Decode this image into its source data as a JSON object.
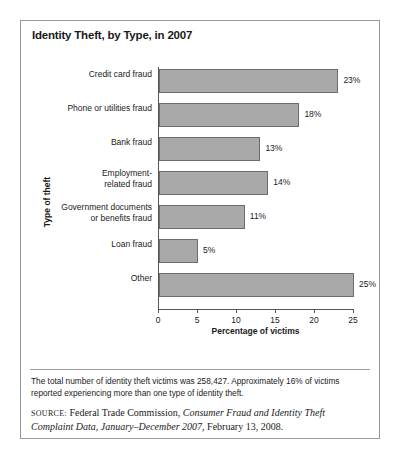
{
  "figure": {
    "title": "Identity Theft, by Type, in 2007",
    "note": "The total number of identity theft victims was 258,427. Approximately 16% of victims reported experiencing more than one type of identity theft.",
    "source": {
      "kicker": "SOURCE:",
      "part1": " Federal Trade Commission, ",
      "italic1": "Consumer Fraud and Identity Theft Complaint Data, January–December 2007",
      "part2": ", February 13, 2008."
    }
  },
  "chart_data": {
    "type": "bar",
    "orientation": "horizontal",
    "title": "Identity Theft, by Type, in 2007",
    "xlabel": "Percentage of victims",
    "ylabel": "Type of theft",
    "xlim": [
      0,
      25
    ],
    "xticks": [
      "0",
      "5",
      "10",
      "15",
      "20",
      "25"
    ],
    "grid": false,
    "legend": false,
    "categories": [
      "Credit card fraud",
      "Phone or utilities fraud",
      "Bank fraud",
      "Employment-related fraud",
      "Government documents or benefits fraud",
      "Loan fraud",
      "Other"
    ],
    "category_lines": [
      [
        "Credit card fraud"
      ],
      [
        "Phone or utilities fraud"
      ],
      [
        "Bank fraud"
      ],
      [
        "Employment-",
        "related fraud"
      ],
      [
        "Government documents",
        "or benefits fraud"
      ],
      [
        "Loan fraud"
      ],
      [
        "Other"
      ]
    ],
    "values": [
      23,
      18,
      13,
      14,
      11,
      5,
      25
    ],
    "value_labels": [
      "23%",
      "18%",
      "13%",
      "14%",
      "11%",
      "5%",
      "25%"
    ],
    "bar_color": "#a9a9a9",
    "bar_edge_color": "#6d6d6d"
  }
}
